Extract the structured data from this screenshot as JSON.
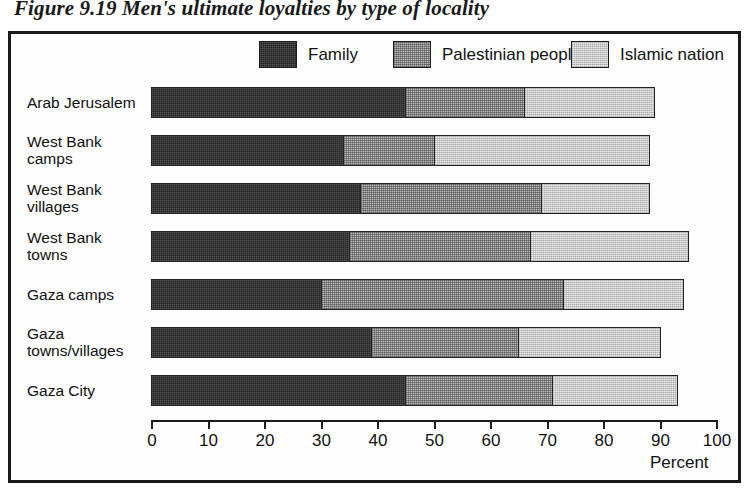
{
  "figure": {
    "title": "Figure 9.19 Men's ultimate loyalties by type of locality"
  },
  "legend": {
    "position": "top-center",
    "entries": [
      {
        "label": "Family",
        "swatch": "dark-crosshatch-swatch",
        "color": "#231f20"
      },
      {
        "label": "Palestinian people",
        "swatch": "medium-gray-checker-swatch",
        "color": "#b9b9b9"
      },
      {
        "label": "Islamic nation",
        "swatch": "light-gray-checker-swatch",
        "color": "#ececec"
      }
    ]
  },
  "axis": {
    "unit_label": "Percent",
    "ticks": [
      "0",
      "10",
      "20",
      "30",
      "40",
      "50",
      "60",
      "70",
      "80",
      "90",
      "100"
    ]
  },
  "chart_data": {
    "type": "bar",
    "orientation": "horizontal",
    "stacked": true,
    "title": "Figure 9.19 Men's ultimate loyalties by type of locality",
    "xlabel": "Percent",
    "ylabel": "",
    "xlim": [
      0,
      100
    ],
    "xticks": [
      0,
      10,
      20,
      30,
      40,
      50,
      60,
      70,
      80,
      90,
      100
    ],
    "grid": false,
    "legend_position": "top-center",
    "categories": [
      "Arab Jerusalem",
      "West Bank camps",
      "West Bank villages",
      "West Bank towns",
      "Gaza camps",
      "Gaza towns/villages",
      "Gaza City"
    ],
    "category_lines": [
      [
        "Arab Jerusalem"
      ],
      [
        "West Bank",
        "camps"
      ],
      [
        "West Bank",
        "villages"
      ],
      [
        "West Bank",
        "towns"
      ],
      [
        "Gaza camps"
      ],
      [
        "Gaza",
        "towns/villages"
      ],
      [
        "Gaza City"
      ]
    ],
    "series": [
      {
        "name": "Family",
        "values": [
          45,
          34,
          37,
          35,
          30,
          39,
          45
        ]
      },
      {
        "name": "Palestinian people",
        "values": [
          21,
          16,
          32,
          32,
          43,
          26,
          26
        ]
      },
      {
        "name": "Islamic nation",
        "values": [
          23,
          38,
          19,
          28,
          21,
          25,
          22
        ]
      }
    ],
    "totals": [
      89,
      88,
      88,
      95,
      94,
      90,
      93
    ]
  }
}
